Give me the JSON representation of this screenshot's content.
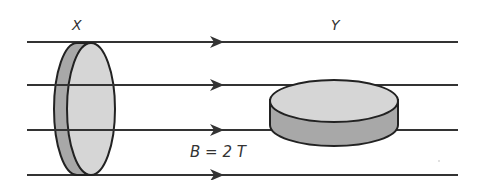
{
  "labels": {
    "disc_x": "X",
    "disc_y": "Y",
    "field": "B = 2 T"
  },
  "colors": {
    "line": "#333333",
    "disc_face": "#d6d6d6",
    "disc_side": "#a8a8a8"
  },
  "field_lines": 4
}
